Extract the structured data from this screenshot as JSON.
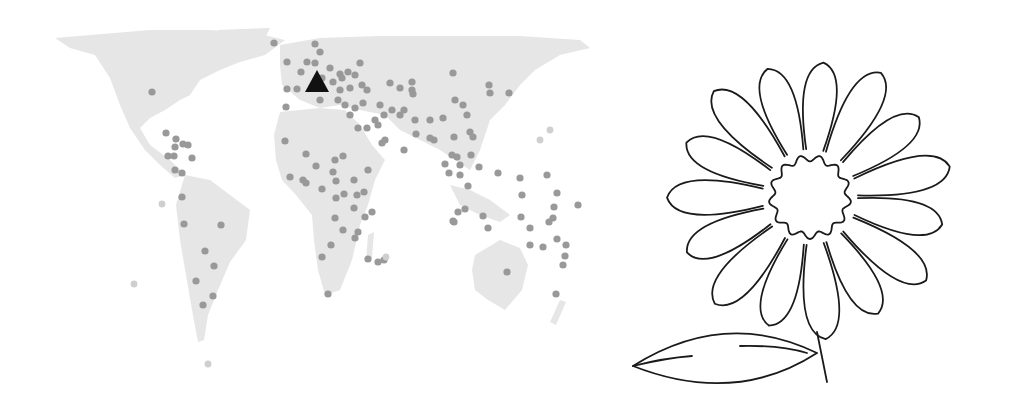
{
  "map": {
    "land_color": "#e6e6e6",
    "dot_color": "#999999",
    "faint_dot_color": "#cfcfcf",
    "marker_color": "#111111",
    "marker": {
      "shape": "triangle",
      "x": 317,
      "y": 83
    },
    "dots": [
      [
        152,
        92
      ],
      [
        274,
        43
      ],
      [
        315,
        44
      ],
      [
        320,
        52
      ],
      [
        307,
        62
      ],
      [
        315,
        63
      ],
      [
        330,
        68
      ],
      [
        287,
        62
      ],
      [
        301,
        72
      ],
      [
        322,
        78
      ],
      [
        333,
        82
      ],
      [
        342,
        78
      ],
      [
        348,
        72
      ],
      [
        355,
        75
      ],
      [
        362,
        85
      ],
      [
        367,
        90
      ],
      [
        287,
        89
      ],
      [
        297,
        89
      ],
      [
        320,
        100
      ],
      [
        286,
        107
      ],
      [
        340,
        74
      ],
      [
        360,
        63
      ],
      [
        340,
        90
      ],
      [
        350,
        88
      ],
      [
        338,
        100
      ],
      [
        363,
        103
      ],
      [
        380,
        105
      ],
      [
        390,
        83
      ],
      [
        400,
        88
      ],
      [
        404,
        110
      ],
      [
        412,
        82
      ],
      [
        413,
        94
      ],
      [
        415,
        120
      ],
      [
        412,
        90
      ],
      [
        392,
        110
      ],
      [
        375,
        120
      ],
      [
        367,
        128
      ],
      [
        358,
        128
      ],
      [
        350,
        115
      ],
      [
        355,
        108
      ],
      [
        345,
        105
      ],
      [
        384,
        115
      ],
      [
        385,
        140
      ],
      [
        378,
        125
      ],
      [
        382,
        143
      ],
      [
        400,
        115
      ],
      [
        430,
        120
      ],
      [
        404,
        150
      ],
      [
        416,
        134
      ],
      [
        430,
        138
      ],
      [
        434,
        140
      ],
      [
        443,
        118
      ],
      [
        453,
        73
      ],
      [
        455,
        100
      ],
      [
        463,
        105
      ],
      [
        467,
        115
      ],
      [
        470,
        132
      ],
      [
        473,
        137
      ],
      [
        489,
        85
      ],
      [
        490,
        93
      ],
      [
        509,
        93
      ],
      [
        520,
        178
      ],
      [
        454,
        137
      ],
      [
        457,
        157
      ],
      [
        452,
        155
      ],
      [
        460,
        165
      ],
      [
        460,
        175
      ],
      [
        445,
        164
      ],
      [
        449,
        173
      ],
      [
        471,
        155
      ],
      [
        479,
        167
      ],
      [
        498,
        173
      ],
      [
        522,
        195
      ],
      [
        547,
        175
      ],
      [
        557,
        193
      ],
      [
        554,
        207
      ],
      [
        553,
        218
      ],
      [
        530,
        228
      ],
      [
        458,
        212
      ],
      [
        453,
        221
      ],
      [
        454,
        222
      ],
      [
        468,
        186
      ],
      [
        488,
        228
      ],
      [
        557,
        239
      ],
      [
        566,
        245
      ],
      [
        565,
        256
      ],
      [
        563,
        265
      ],
      [
        530,
        245
      ],
      [
        543,
        247
      ],
      [
        549,
        222
      ],
      [
        507,
        272
      ],
      [
        483,
        216
      ],
      [
        465,
        209
      ],
      [
        521,
        217
      ],
      [
        578,
        205
      ],
      [
        556,
        294
      ],
      [
        182,
        197
      ],
      [
        184,
        224
      ],
      [
        221,
        225
      ],
      [
        205,
        251
      ],
      [
        214,
        266
      ],
      [
        196,
        281
      ],
      [
        203,
        305
      ],
      [
        213,
        296
      ],
      [
        166,
        133
      ],
      [
        176,
        139
      ],
      [
        175,
        147
      ],
      [
        183,
        144
      ],
      [
        168,
        156
      ],
      [
        174,
        156
      ],
      [
        175,
        170
      ],
      [
        182,
        173
      ],
      [
        188,
        145
      ],
      [
        192,
        158
      ],
      [
        285,
        141
      ],
      [
        306,
        154
      ],
      [
        303,
        180
      ],
      [
        290,
        177
      ],
      [
        316,
        166
      ],
      [
        335,
        160
      ],
      [
        343,
        156
      ],
      [
        333,
        172
      ],
      [
        306,
        183
      ],
      [
        322,
        189
      ],
      [
        336,
        181
      ],
      [
        336,
        198
      ],
      [
        344,
        194
      ],
      [
        357,
        195
      ],
      [
        364,
        192
      ],
      [
        368,
        170
      ],
      [
        354,
        180
      ],
      [
        372,
        212
      ],
      [
        365,
        217
      ],
      [
        384,
        260
      ],
      [
        368,
        259
      ],
      [
        378,
        262
      ],
      [
        354,
        208
      ],
      [
        335,
        218
      ],
      [
        355,
        238
      ],
      [
        331,
        245
      ],
      [
        322,
        257
      ],
      [
        343,
        230
      ],
      [
        358,
        232
      ],
      [
        328,
        294
      ]
    ],
    "faint_dots": [
      [
        134,
        284
      ],
      [
        162,
        204
      ],
      [
        208,
        364
      ],
      [
        386,
        257
      ],
      [
        540,
        140
      ],
      [
        550,
        130
      ]
    ]
  },
  "flower": {
    "stroke_color": "#1a1a1a",
    "petal_count": 15,
    "center": {
      "x": 190,
      "y": 157
    },
    "stem": {
      "from": [
        197,
        292
      ],
      "to": [
        207,
        342
      ]
    },
    "leaf": {
      "tip": [
        13,
        326
      ],
      "base": [
        197,
        313
      ]
    }
  }
}
